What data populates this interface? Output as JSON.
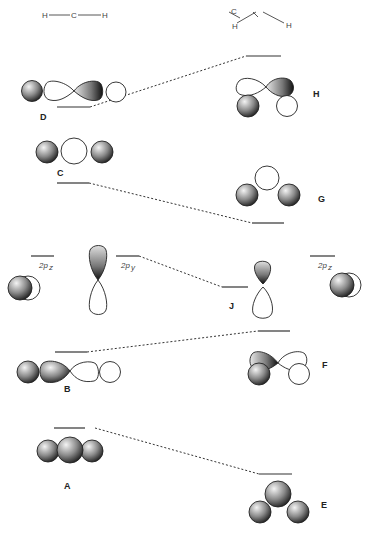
{
  "molecules": {
    "linear": {
      "atoms": [
        "H",
        "C",
        "H"
      ]
    },
    "bent": {
      "atoms": [
        "H",
        "C",
        "H"
      ]
    }
  },
  "orbital_labels": {
    "A": "A",
    "B": "B",
    "C": "C",
    "D": "D",
    "E": "E",
    "F": "F",
    "G": "G",
    "H": "H",
    "J": "J"
  },
  "p_orbitals": {
    "left_pz": {
      "main": "2p",
      "sub": "z"
    },
    "left_py": {
      "main": "2p",
      "sub": "y"
    },
    "right_pz": {
      "main": "2p",
      "sub": "z"
    }
  },
  "colors": {
    "shaded_light": "#f0f0f0",
    "shaded_dark": "#1a1a1a",
    "outline": "#222222",
    "level": "#333333"
  }
}
